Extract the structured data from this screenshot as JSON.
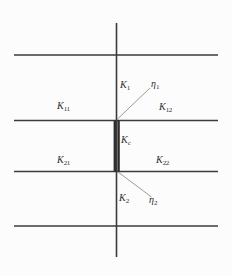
{
  "diagram": {
    "colors": {
      "line": "#3b3b3b",
      "coupling_bar": "#2e2e2e",
      "leader": "#8f8f8f",
      "text": "#2f2f2f",
      "background": "#fcfcfc"
    },
    "labels": {
      "K1": {
        "base": "K",
        "sub": "1"
      },
      "eta1": {
        "base": "η",
        "sub": "1"
      },
      "K11": {
        "base": "K",
        "sub": "11"
      },
      "K12": {
        "base": "K",
        "sub": "12"
      },
      "Kc": {
        "base": "K",
        "sub": "c"
      },
      "K21": {
        "base": "K",
        "sub": "21"
      },
      "K22": {
        "base": "K",
        "sub": "22"
      },
      "K2": {
        "base": "K",
        "sub": "2"
      },
      "eta2": {
        "base": "η",
        "sub": "2"
      }
    }
  }
}
